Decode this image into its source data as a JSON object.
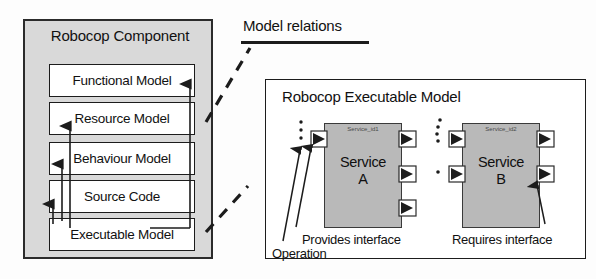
{
  "figure": {
    "relations_label": "Model relations"
  },
  "component_panel": {
    "title": "Robocop Component",
    "models": [
      {
        "label": "Functional Model"
      },
      {
        "label": "Resource Model"
      },
      {
        "label": "Behaviour Model"
      },
      {
        "label": "Source Code"
      },
      {
        "label": "Executable Model"
      }
    ]
  },
  "executable_panel": {
    "title": "Robocop Executable Model",
    "services": [
      {
        "id_label": "Service_id1",
        "name_line1": "Service",
        "name_line2": "A"
      },
      {
        "id_label": "Service_id2",
        "name_line1": "Service",
        "name_line2": "B"
      }
    ],
    "captions": {
      "provides": "Provides interface",
      "operation": "Operation",
      "requires": "Requires interface"
    }
  },
  "colors": {
    "component_fill": "#d9d9d9",
    "model_box_fill": "#ffffff",
    "service_fill": "#b9b9b9",
    "panel_fill": "#ffffff",
    "stroke": "#1c1c1c"
  }
}
